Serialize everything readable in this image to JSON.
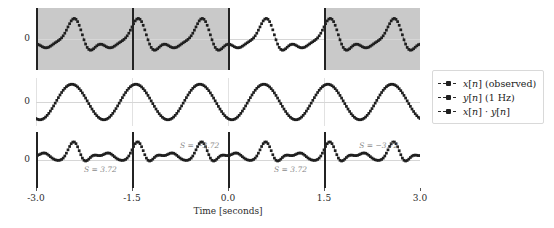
{
  "chart_data": {
    "type": "line",
    "title": "",
    "xlabel": "Time [seconds]",
    "ylabel": "",
    "xlim": [
      -3.0,
      3.0
    ],
    "xticks": [
      "-3.0",
      "-1.5",
      "0.0",
      "1.5",
      "3.0"
    ],
    "xtick_values": [
      -3.0,
      -1.5,
      0.0,
      1.5,
      3.0
    ],
    "grid": false,
    "legend_position": "right",
    "sample_rate_hz": 40,
    "panels": [
      {
        "name": "observed-signal",
        "series_name": "x[n] (observed)",
        "yticks": [
          "0"
        ],
        "ytick_values": [
          0
        ],
        "ylim": [
          -1.6,
          1.6
        ],
        "shaded_windows": [
          [
            -3.0,
            -1.5
          ],
          [
            -1.5,
            0.0
          ],
          [
            1.5,
            3.0
          ]
        ],
        "boundary_lines": [
          -3.0,
          -1.5,
          0.0,
          1.5,
          3.0
        ],
        "values": [
          -1.22,
          -1.1,
          -0.95,
          -0.78,
          -0.6,
          -0.42,
          -0.26,
          -0.12,
          0.0,
          0.1,
          0.2,
          0.3,
          0.36,
          0.4,
          0.38,
          0.33,
          0.25,
          0.15,
          0.05,
          -0.03,
          -0.08,
          -0.1,
          -0.08,
          -0.02,
          0.08,
          0.22,
          0.4,
          0.6,
          0.8,
          0.98,
          1.12,
          1.2,
          1.2,
          1.12,
          0.98,
          0.78,
          0.56,
          0.35,
          0.16,
          0.02,
          -0.08,
          -0.14,
          -0.16,
          -0.16,
          -0.14,
          -0.12,
          -0.1,
          -0.09,
          -0.08,
          -0.08,
          -1.22,
          -1.1,
          -0.95,
          -0.78,
          -0.6,
          -0.42,
          -0.26,
          -0.12,
          0.0,
          0.1,
          0.2,
          0.3,
          0.36,
          0.4,
          0.38,
          0.33,
          0.25,
          0.15,
          0.05,
          -0.03,
          -0.08,
          -0.1,
          -0.08,
          -0.02,
          0.08,
          0.22,
          0.4,
          0.6,
          0.8,
          0.98,
          1.12,
          1.2,
          1.2,
          1.12,
          0.98,
          0.78,
          0.56,
          0.35,
          0.16,
          0.02,
          -0.08,
          -0.14,
          -0.16,
          -0.16,
          -0.14,
          -0.12,
          -0.1,
          -0.09,
          -0.08,
          -0.08,
          -1.22,
          -1.1,
          -0.95,
          -0.78,
          -0.6,
          -0.42,
          -0.26,
          -0.12,
          0.0,
          0.1,
          0.2,
          0.3,
          0.36,
          0.4,
          0.38,
          0.33,
          0.25,
          0.15,
          0.05,
          -0.03,
          -0.08,
          -0.1,
          -0.08,
          -0.02,
          0.08,
          0.22,
          0.4,
          0.6,
          0.8,
          0.98,
          1.12,
          1.2,
          1.2,
          1.12,
          0.98,
          0.78,
          0.56,
          0.35,
          0.16,
          0.02,
          -0.08,
          -0.14,
          -0.16,
          -0.16,
          -0.14,
          -0.12,
          -0.1,
          -0.09,
          -0.08,
          -0.08,
          -1.22,
          -1.1,
          -0.95,
          -0.78,
          -0.6,
          -0.42,
          -0.26,
          -0.12,
          0.0,
          0.1,
          0.2,
          0.3,
          0.36,
          0.4,
          0.38,
          0.33,
          0.25,
          0.15,
          0.05,
          -0.03,
          -0.08,
          -0.1,
          -0.08,
          -0.02,
          0.08,
          0.22,
          0.4,
          0.6,
          0.8,
          0.98,
          1.12,
          1.2,
          1.2,
          1.12,
          0.98,
          0.78,
          0.56,
          0.35,
          0.16,
          0.02,
          -0.08,
          -0.14,
          -0.16,
          -0.16,
          -0.14,
          -0.12,
          -0.1,
          -0.09,
          -0.08,
          -0.08
        ]
      },
      {
        "name": "reference-sinusoid",
        "series_name": "y[n] (1 Hz)",
        "yticks": [
          "0"
        ],
        "ytick_values": [
          0
        ],
        "ylim": [
          -1.35,
          1.35
        ],
        "frequency_hz": 1.0,
        "amplitude": 1.0,
        "shaded_windows": [],
        "boundary_lines": []
      },
      {
        "name": "product-signal",
        "series_name": "x[n] · y[n]",
        "yticks": [
          "0"
        ],
        "ytick_values": [
          0
        ],
        "ylim": [
          -1.6,
          1.6
        ],
        "shaded_windows": [],
        "boundary_lines": [
          -3.0,
          -1.5,
          0.0,
          1.5,
          3.0
        ],
        "annotations": [
          {
            "text": "S = 3.72",
            "value": 3.72,
            "x": -2.25,
            "y": -0.55
          },
          {
            "text": "S = −3.72",
            "value": -3.72,
            "x": -0.75,
            "y": 0.78
          },
          {
            "text": "S = 3.72",
            "value": 3.72,
            "x": 0.72,
            "y": -0.55
          },
          {
            "text": "S = −3.72",
            "value": -3.72,
            "x": 2.05,
            "y": 0.78
          }
        ]
      }
    ],
    "legend": [
      {
        "label": "x[n] (observed)",
        "marker": "square-dot",
        "line": "dashed",
        "color": "#1f1f1f"
      },
      {
        "label": "y[n] (1 Hz)",
        "marker": "square-dot",
        "line": "dashed",
        "color": "#1f1f1f"
      },
      {
        "label": "x[n] · y[n]",
        "marker": "square-dot",
        "line": "dashed",
        "color": "#1f1f1f"
      }
    ],
    "colors": {
      "marker": "#1f1f1f",
      "shade": "#c9c9c9",
      "boundary": "#232323",
      "zeroline": "#d6d6d6",
      "annotation": "#8a8a8a",
      "tick_text": "#2b2b2b"
    }
  }
}
